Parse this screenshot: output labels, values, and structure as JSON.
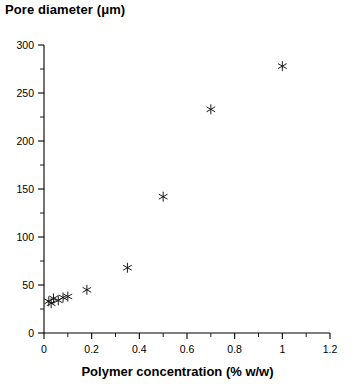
{
  "chart_data": {
    "type": "scatter",
    "title": "",
    "ylabel": "Pore diameter (μm)",
    "xlabel": "Polymer concentration (% w/w)",
    "xlim": [
      0,
      1.2
    ],
    "ylim": [
      0,
      300
    ],
    "x_ticks": [
      0,
      0.2,
      0.4,
      0.6,
      0.8,
      1,
      1.2
    ],
    "x_tick_labels": [
      "0",
      "0.2",
      "0.4",
      "0.6",
      "0.8",
      "1",
      "1.2"
    ],
    "x_minor_step": 0.1,
    "y_ticks": [
      0,
      50,
      100,
      150,
      200,
      250,
      300
    ],
    "y_tick_labels": [
      "0",
      "50",
      "100",
      "150",
      "200",
      "250",
      "300"
    ],
    "y_minor_step": 25,
    "grid": false,
    "legend": null,
    "marker": "asterisk",
    "marker_color": "#111111",
    "points": [
      {
        "x": 0.02,
        "y": 33
      },
      {
        "x": 0.03,
        "y": 31
      },
      {
        "x": 0.04,
        "y": 36
      },
      {
        "x": 0.06,
        "y": 34
      },
      {
        "x": 0.08,
        "y": 37
      },
      {
        "x": 0.1,
        "y": 38
      },
      {
        "x": 0.18,
        "y": 45
      },
      {
        "x": 0.35,
        "y": 68
      },
      {
        "x": 0.5,
        "y": 142
      },
      {
        "x": 0.7,
        "y": 233
      },
      {
        "x": 1.0,
        "y": 278
      }
    ]
  },
  "labels": {
    "y_axis_title": "Pore diameter (μm)",
    "x_axis_title": "Polymer concentration (% w/w)"
  }
}
